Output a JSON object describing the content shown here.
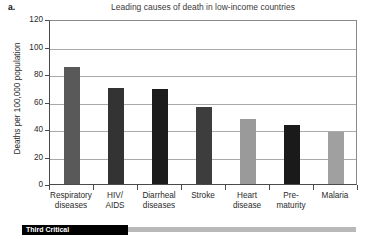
{
  "figure": {
    "panel_letter": "a.",
    "bottom_banner": {
      "text": "Third Critical",
      "visible_note": "partially cropped black banner with white text"
    }
  },
  "chart_data": {
    "type": "bar",
    "title": "Leading causes of death in low-income countries",
    "xlabel": "",
    "ylabel": "Deaths per 100,000 population",
    "ylim": [
      0,
      120
    ],
    "ytick_labels": [
      "120",
      "100",
      "80",
      "60",
      "40",
      "20",
      "0"
    ],
    "ytick_values": [
      120,
      100,
      80,
      60,
      40,
      20,
      0
    ],
    "grid": true,
    "grid_axis": "y",
    "legend": "none",
    "categories": [
      "Respiratory diseases",
      "HIV/ AIDS",
      "Diarrheal diseases",
      "Stroke",
      "Heart disease",
      "Pre- maturity",
      "Malaria"
    ],
    "category_lines": [
      [
        "Respiratory",
        "diseases"
      ],
      [
        "HIV/",
        "AIDS"
      ],
      [
        "Diarrheal",
        "diseases"
      ],
      [
        "Stroke"
      ],
      [
        "Heart",
        "disease"
      ],
      [
        "Pre-",
        "maturity"
      ],
      [
        "Malaria"
      ]
    ],
    "values": [
      85,
      70,
      69,
      56,
      47,
      43,
      38
    ],
    "bar_colors": [
      "#595959",
      "#333333",
      "#1c1c1c",
      "#3d3d3d",
      "#9a9a9a",
      "#1a1a1a",
      "#a0a0a0"
    ]
  },
  "colors": {
    "axis": "#4a4a4a",
    "gridline": "#a9a9a9",
    "text": "#2a2a2a",
    "title_text": "#3a3a3a",
    "background": "#ffffff",
    "banner": "#000000",
    "rule": "#b9b9b9"
  }
}
